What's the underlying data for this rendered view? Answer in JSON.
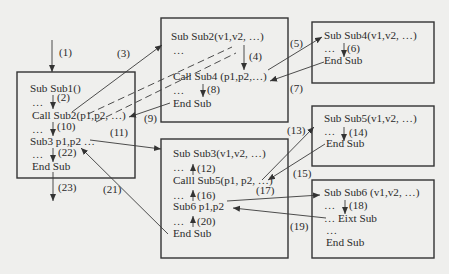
{
  "diagram": {
    "type": "subroutine-call-flow",
    "boxes": [
      {
        "id": "sub1",
        "lines": [
          "Sub  Sub1()",
          "…",
          "Call Sub2(p1,p2, …)",
          "…",
          "Sub3  p1,p2 …",
          "…",
          "End Sub"
        ]
      },
      {
        "id": "sub2",
        "lines": [
          "Sub  Sub2(v1,v2, …)",
          "…",
          "Call Sub4 (p1,p2,…)",
          "…",
          "End Sub"
        ]
      },
      {
        "id": "sub4",
        "lines": [
          "Sub Sub4(v1,v2, …)",
          "…",
          "End Sub"
        ]
      },
      {
        "id": "sub3",
        "lines": [
          "Sub Sub3(v1,v2, …)",
          "…",
          "Calll Sub5(p1, p2, …)",
          "…",
          "Sub6  p1,p2",
          "…",
          "End Sub"
        ]
      },
      {
        "id": "sub5",
        "lines": [
          "Sub Sub5(v1,v2, …)",
          "…",
          "End Sub"
        ]
      },
      {
        "id": "sub6",
        "lines": [
          "Sub Sub6 (v1,v2, …)",
          "…",
          "… Eixt Sub",
          "…",
          "End Sub"
        ]
      }
    ],
    "step_labels": [
      "(1)",
      "(2)",
      "(3)",
      "(4)",
      "(5)",
      "(6)",
      "(7)",
      "(8)",
      "(9)",
      "(10)",
      "(11)",
      "(12)",
      "(13)",
      "(14)",
      "(15)",
      "(16)",
      "(17)",
      "(18)",
      "(19)",
      "(20)",
      "(21)",
      "(22)",
      "(23)"
    ],
    "edges": [
      {
        "label": "(1)",
        "from": "entry",
        "to": "sub1",
        "style": "solid"
      },
      {
        "label": "(2)",
        "from": "sub1",
        "to": "sub1",
        "style": "solid"
      },
      {
        "label": "(3)",
        "from": "sub1",
        "to": "sub2",
        "style": "solid+dashed"
      },
      {
        "label": "(4)",
        "from": "sub2",
        "to": "sub2",
        "style": "solid"
      },
      {
        "label": "(5)",
        "from": "sub2",
        "to": "sub4",
        "style": "solid"
      },
      {
        "label": "(6)",
        "from": "sub4",
        "to": "sub4",
        "style": "solid"
      },
      {
        "label": "(7)",
        "from": "sub4",
        "to": "sub2",
        "style": "solid"
      },
      {
        "label": "(8)",
        "from": "sub2",
        "to": "sub2",
        "style": "solid"
      },
      {
        "label": "(9)",
        "from": "sub2",
        "to": "sub1",
        "style": "solid"
      },
      {
        "label": "(10)",
        "from": "sub1",
        "to": "sub1",
        "style": "solid"
      },
      {
        "label": "(11)",
        "from": "sub1",
        "to": "sub3",
        "style": "solid"
      },
      {
        "label": "(12)",
        "from": "sub3",
        "to": "sub3",
        "style": "solid"
      },
      {
        "label": "(13)",
        "from": "sub3",
        "to": "sub5",
        "style": "solid"
      },
      {
        "label": "(14)",
        "from": "sub5",
        "to": "sub5",
        "style": "solid"
      },
      {
        "label": "(15)",
        "from": "sub5",
        "to": "sub3",
        "style": "solid"
      },
      {
        "label": "(16)",
        "from": "sub3",
        "to": "sub3",
        "style": "solid"
      },
      {
        "label": "(17)",
        "from": "sub3",
        "to": "sub6",
        "style": "solid"
      },
      {
        "label": "(18)",
        "from": "sub6",
        "to": "sub6",
        "style": "solid"
      },
      {
        "label": "(19)",
        "from": "sub6",
        "to": "sub3",
        "style": "solid"
      },
      {
        "label": "(20)",
        "from": "sub3",
        "to": "sub3",
        "style": "solid"
      },
      {
        "label": "(21)",
        "from": "sub3",
        "to": "sub1",
        "style": "solid"
      },
      {
        "label": "(22)",
        "from": "sub1",
        "to": "sub1",
        "style": "solid"
      },
      {
        "label": "(23)",
        "from": "sub1",
        "to": "exit",
        "style": "solid"
      }
    ]
  }
}
